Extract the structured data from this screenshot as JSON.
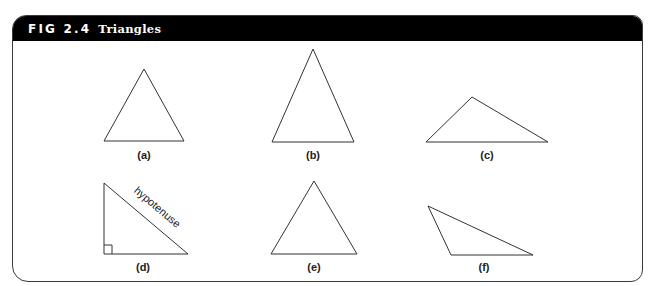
{
  "figure": {
    "number": "FIG 2.4",
    "title": "Triangles",
    "colors": {
      "header_bg": "#000000",
      "header_text": "#ffffff",
      "line": "#333333"
    }
  },
  "triangles": [
    {
      "id": "a",
      "label": "(a)",
      "type": "equilateral"
    },
    {
      "id": "b",
      "label": "(b)",
      "type": "isosceles"
    },
    {
      "id": "c",
      "label": "(c)",
      "type": "obtuse"
    },
    {
      "id": "d",
      "label": "(d)",
      "type": "right",
      "side_label": "hypotenuse"
    },
    {
      "id": "e",
      "label": "(e)",
      "type": "acute"
    },
    {
      "id": "f",
      "label": "(f)",
      "type": "obtuse-scalene"
    }
  ]
}
